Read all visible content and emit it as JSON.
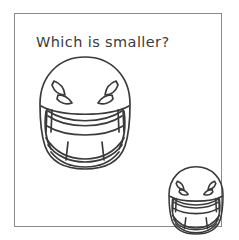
{
  "worksheet": {
    "prompt": "Which is smaller?",
    "frame": {
      "border_color": "#8a8a8a",
      "background_color": "#ffffff"
    },
    "text_color": "#3b3b3b",
    "line_color": "#3a3a3a"
  },
  "objects": [
    {
      "id": "helmet-large",
      "name": "football-helmet",
      "size_label": "large",
      "position": "upper-left",
      "relative_size": 1.0,
      "vent_holes_per_side": 2,
      "facemask_bars": 2,
      "chin_bar_dividers": 2
    },
    {
      "id": "helmet-small",
      "name": "football-helmet",
      "size_label": "small",
      "position": "lower-right",
      "relative_size": 0.6,
      "vent_holes_per_side": 2,
      "facemask_bars": 2,
      "chin_bar_dividers": 2
    }
  ],
  "answer_choices": [
    {
      "label": "large",
      "is_correct": false
    },
    {
      "label": "small",
      "is_correct": true
    }
  ]
}
